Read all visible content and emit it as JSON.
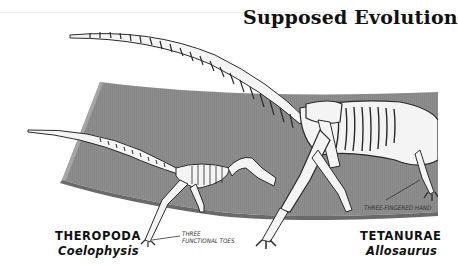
{
  "title": "Supposed Evolution",
  "colors": {
    "band": "#8f8f8f",
    "band_dark": "#6d6d6d",
    "bone": "#f4f4f4",
    "bone_outline": "#2a2a2a",
    "text": "#111111"
  },
  "specimens": [
    {
      "group": "THEROPODA",
      "genus": "Coelophysis",
      "annotation_line1": "THREE",
      "annotation_line2": "FUNCTIONAL TOES"
    },
    {
      "group": "TETANURAE",
      "genus": "Allosaurus",
      "annotation_line1": "THREE-FINGERED HAND"
    }
  ]
}
